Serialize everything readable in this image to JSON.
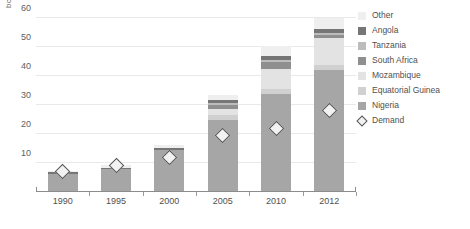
{
  "chart_data": {
    "type": "bar",
    "title": "",
    "subtitle": "",
    "xlabel": "",
    "ylabel": "bcm",
    "stacked": true,
    "grid": true,
    "legend_position": "right",
    "categories": [
      "1990",
      "1995",
      "2000",
      "2005",
      "2010",
      "2012"
    ],
    "ylim": [
      0,
      62
    ],
    "yticks": [
      10,
      20,
      30,
      40,
      50,
      60
    ],
    "ytick_labels": [
      "10",
      "20",
      "30",
      "40",
      "50",
      "60"
    ],
    "series": [
      {
        "name": "Nigeria",
        "color": "#a6a6a6",
        "values": [
          6.0,
          7.6,
          14.2,
          24.5,
          33.3,
          41.8
        ]
      },
      {
        "name": "Equatorial Guinea",
        "color": "#d0d0d0",
        "values": [
          0.0,
          0.0,
          0.0,
          1.6,
          1.7,
          1.6
        ]
      },
      {
        "name": "Mozambique",
        "color": "#e3e3e3",
        "values": [
          0.0,
          0.0,
          0.0,
          2.0,
          7.0,
          9.2
        ]
      },
      {
        "name": "South Africa",
        "color": "#8f8f8f",
        "values": [
          0.0,
          0.0,
          0.0,
          1.5,
          2.6,
          1.2
        ]
      },
      {
        "name": "Tanzania",
        "color": "#bcbcbc",
        "values": [
          0.0,
          0.0,
          0.0,
          0.6,
          0.7,
          0.7
        ]
      },
      {
        "name": "Angola",
        "color": "#767676",
        "values": [
          0.5,
          0.5,
          0.5,
          1.0,
          1.2,
          1.3
        ]
      },
      {
        "name": "Other",
        "color": "#efefef",
        "values": [
          0.5,
          0.9,
          1.3,
          1.8,
          3.5,
          3.7
        ]
      }
    ],
    "overlay": {
      "name": "Demand",
      "marker": "diamond",
      "marker_fill": "#f2f2f2",
      "marker_edge": "#555555",
      "values": [
        7.0,
        9.0,
        12.0,
        19.5,
        22.0,
        28.0
      ]
    },
    "legend_entries": [
      {
        "label": "Other",
        "swatch": "#efefef",
        "kind": "swatch"
      },
      {
        "label": "Angola",
        "swatch": "#767676",
        "kind": "swatch"
      },
      {
        "label": "Tanzania",
        "swatch": "#bcbcbc",
        "kind": "swatch"
      },
      {
        "label": "South Africa",
        "swatch": "#8f8f8f",
        "kind": "swatch"
      },
      {
        "label": "Mozambique",
        "swatch": "#e3e3e3",
        "kind": "swatch"
      },
      {
        "label": "Equatorial Guinea",
        "swatch": "#d0d0d0",
        "kind": "swatch"
      },
      {
        "label": "Nigeria",
        "swatch": "#a6a6a6",
        "kind": "swatch"
      },
      {
        "label": "Demand",
        "swatch": "#f2f2f2",
        "kind": "diamond"
      }
    ]
  }
}
